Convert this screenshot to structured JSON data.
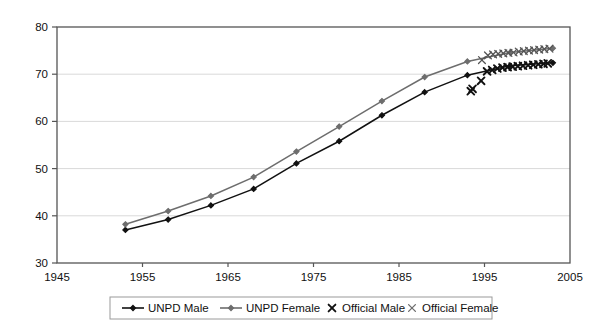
{
  "chart_data": {
    "type": "line",
    "title": "",
    "subtitle": "",
    "xlabel": "",
    "ylabel": "",
    "xlim": [
      1945,
      2005
    ],
    "ylim": [
      30,
      80
    ],
    "xticks": [
      1945,
      1955,
      1965,
      1975,
      1985,
      1995,
      2005
    ],
    "yticks": [
      30,
      40,
      50,
      60,
      70,
      80
    ],
    "grid": "horizontal",
    "legend_position": "bottom",
    "series": [
      {
        "name": "UNPD Male",
        "marker": "diamond",
        "style": "line-marker",
        "color": "#111111",
        "x": [
          1953,
          1958,
          1963,
          1968,
          1973,
          1978,
          1983,
          1988,
          1993,
          1998,
          2003
        ],
        "values": [
          37.0,
          39.2,
          42.2,
          45.7,
          51.1,
          55.8,
          61.3,
          66.2,
          69.8,
          71.8,
          72.4
        ]
      },
      {
        "name": "UNPD Female",
        "marker": "diamond",
        "style": "line-marker",
        "color": "#6d6d6d",
        "x": [
          1953,
          1958,
          1963,
          1968,
          1973,
          1978,
          1983,
          1988,
          1993,
          1998,
          2003
        ],
        "values": [
          38.2,
          41.0,
          44.2,
          48.2,
          53.6,
          58.9,
          64.3,
          69.4,
          72.7,
          74.6,
          75.5
        ]
      },
      {
        "name": "Official Male",
        "marker": "x",
        "style": "scatter",
        "color": "#111111",
        "x": [
          1993.6,
          1993.4,
          1994.6,
          1995.3,
          1995.9,
          1996.5,
          1997.1,
          1997.7,
          1998.3,
          1998.9,
          1999.5,
          2000.1,
          2000.7,
          2001.3,
          2001.9,
          2002.4
        ],
        "values": [
          66.9,
          66.4,
          68.6,
          70.6,
          70.9,
          71.2,
          71.4,
          71.5,
          71.6,
          71.7,
          71.8,
          71.9,
          72.0,
          72.1,
          72.2,
          72.3
        ]
      },
      {
        "name": "Official Female",
        "marker": "x",
        "style": "scatter",
        "color": "#555555",
        "x": [
          1994.7,
          1995.4,
          1996.0,
          1996.6,
          1997.2,
          1997.8,
          1998.4,
          1999.0,
          1999.6,
          2000.2,
          2000.8,
          2001.4,
          2002.0,
          2002.6
        ],
        "values": [
          73.0,
          74.0,
          74.2,
          74.3,
          74.4,
          74.5,
          74.6,
          74.8,
          74.9,
          75.0,
          75.1,
          75.2,
          75.3,
          75.4
        ]
      }
    ],
    "legend": [
      {
        "label": "UNPD Male",
        "marker": "line-diamond",
        "color": "#111111"
      },
      {
        "label": "UNPD Female",
        "marker": "line-diamond",
        "color": "#6d6d6d"
      },
      {
        "label": "Official Male",
        "marker": "x",
        "color": "#111111"
      },
      {
        "label": "Official Female",
        "marker": "x",
        "color": "#6d6d6d"
      }
    ],
    "axis_color": "#555555",
    "grid_color": "#d9d9d9",
    "background": "#ffffff"
  }
}
